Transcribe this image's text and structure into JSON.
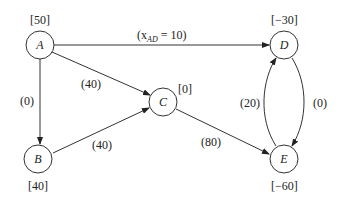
{
  "nodes": {
    "A": {
      "name": "A",
      "supply": "[50]"
    },
    "B": {
      "name": "B",
      "supply": "[40]"
    },
    "C": {
      "name": "C",
      "supply": "[0]"
    },
    "D": {
      "name": "D",
      "supply": "[−30]"
    },
    "E": {
      "name": "E",
      "supply": "[−60]"
    }
  },
  "edges": {
    "AD": {
      "prefix": "(x",
      "sub": "AD",
      "suffix": " = 10)"
    },
    "AC": {
      "label": "(40)"
    },
    "AB": {
      "label": "(0)"
    },
    "BC": {
      "label": "(40)"
    },
    "CE": {
      "label": "(80)"
    },
    "ED": {
      "label": "(20)"
    },
    "DE": {
      "label": "(0)"
    }
  },
  "colors": {
    "stroke": "#333333",
    "background": "#ffffff"
  }
}
